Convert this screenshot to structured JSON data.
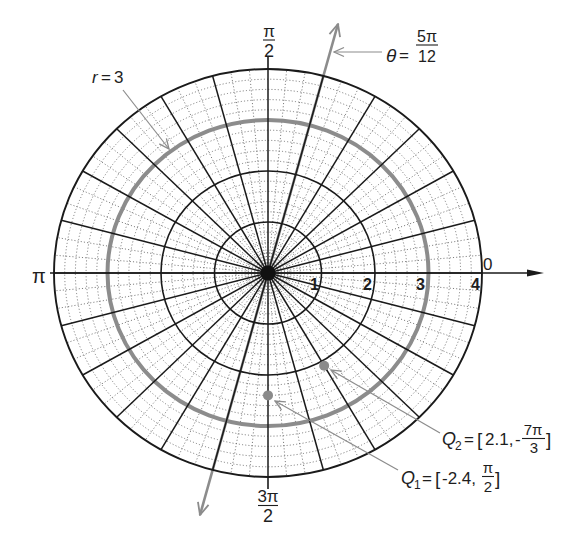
{
  "diagram": {
    "type": "polar-coordinate-grid",
    "rings": [
      1,
      2,
      3,
      4
    ],
    "highlighted_ring": 3,
    "minor_ring_step": 0.2,
    "major_spoke_step_deg": 15,
    "minor_spoke_step_deg": 5
  },
  "axis_labels": {
    "zero": "0",
    "pi": "π",
    "half_pi": {
      "num": "π",
      "den": "2"
    },
    "three_half_pi": {
      "num": "3π",
      "den": "2"
    }
  },
  "radial_labels": [
    "1",
    "2",
    "3",
    "4"
  ],
  "annotations": {
    "ring": {
      "var": "r",
      "eq": "=",
      "value": "3"
    },
    "ray": {
      "var": "θ",
      "eq": "=",
      "num": "5π",
      "den": "12",
      "angle_deg": 75
    }
  },
  "points": [
    {
      "name": "Q",
      "sub": "1",
      "r": -2.4,
      "theta_deg": 90,
      "eq": "=",
      "open": "[",
      "r_text": "-2.4,",
      "sign": "",
      "num": "π",
      "den": "2",
      "close": "]"
    },
    {
      "name": "Q",
      "sub": "2",
      "r": 2.1,
      "theta_deg": -420,
      "eq": "=",
      "open": "[",
      "r_text": "2.1,",
      "sign": "-",
      "num": "7π",
      "den": "3",
      "close": "]"
    }
  ],
  "colors": {
    "major_grid": "#1a1a1a",
    "minor_grid": "#6e6e6e",
    "highlight": "#8c8c8c",
    "point": "#8a8a8a"
  }
}
